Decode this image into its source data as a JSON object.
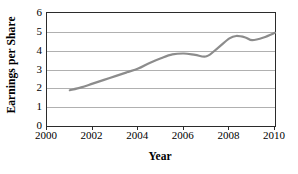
{
  "chart_data": {
    "type": "line",
    "title": "",
    "xlabel": "Year",
    "ylabel": "Earnings per Share",
    "xlim": [
      2000,
      2010
    ],
    "ylim": [
      0,
      6
    ],
    "xticks": [
      2000,
      2002,
      2004,
      2006,
      2008,
      2010
    ],
    "xtick_labels": [
      "2000",
      "2002",
      "2004",
      "2006",
      "2008",
      "2010"
    ],
    "yticks": [
      0,
      1,
      2,
      3,
      4,
      5,
      6
    ],
    "ytick_labels": [
      "0",
      "1",
      "2",
      "3",
      "4",
      "5",
      "6"
    ],
    "grid": "horizontal",
    "legend": "none",
    "series": [
      {
        "name": "Earnings per Share",
        "color": "#8c8c8c",
        "x": [
          2001,
          2001.5,
          2002,
          2002.5,
          2003,
          2003.5,
          2004,
          2004.5,
          2005,
          2005.5,
          2006,
          2006.5,
          2007,
          2007.5,
          2008,
          2008.3,
          2008.7,
          2009,
          2009.5,
          2010
        ],
        "values": [
          1.9,
          2.05,
          2.25,
          2.45,
          2.65,
          2.85,
          3.05,
          3.35,
          3.6,
          3.8,
          3.85,
          3.78,
          3.7,
          4.15,
          4.65,
          4.78,
          4.7,
          4.56,
          4.7,
          4.95
        ]
      }
    ]
  },
  "axes": {
    "y_title": "Earnings per Share",
    "x_title": "Year"
  }
}
